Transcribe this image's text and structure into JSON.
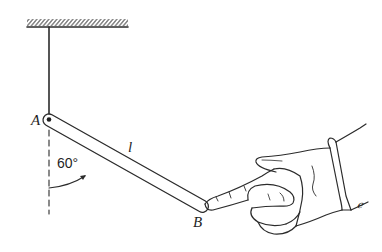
{
  "figure": {
    "type": "physics-diagram",
    "labels": {
      "point_a": "A",
      "point_b": "B",
      "rod_length": "l",
      "angle": "60°",
      "cuff_mark": "ℯ"
    },
    "geometry": {
      "ceiling": {
        "x1": 27,
        "x2": 128,
        "y": 27
      },
      "string": {
        "x": 49,
        "y_top": 27,
        "y_bottom": 119
      },
      "pivot_a": {
        "x": 49,
        "y": 120
      },
      "rod_end_b": {
        "x": 202,
        "y": 206
      },
      "angle_degrees": 60,
      "rod_width": 12
    },
    "colors": {
      "ink": "#2b2b2b",
      "background": "#ffffff"
    }
  }
}
